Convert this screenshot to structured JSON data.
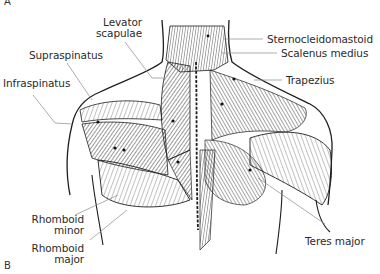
{
  "figure": {
    "panel_top": "A",
    "panel_bottom": "B",
    "colors": {
      "ink": "#1e1e1e",
      "leader": "#8a8a8a",
      "background": "#ffffff"
    }
  },
  "labels": {
    "levator_scapulae_1": "Levator",
    "levator_scapulae_2": "scapulae",
    "supraspinatus": "Supraspinatus",
    "infraspinatus": "Infraspinatus",
    "sternocleidomastoid": "Sternocleidomastoid",
    "scalenus_medius": "Scalenus medius",
    "trapezius": "Trapezius",
    "rhomboid_minor_1": "Rhomboid",
    "rhomboid_minor_2": "minor",
    "rhomboid_major_1": "Rhomboid",
    "rhomboid_major_2": "major",
    "teres_major": "Teres major"
  }
}
